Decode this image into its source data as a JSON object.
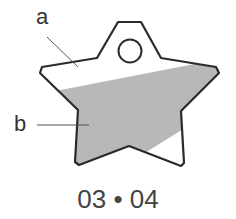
{
  "labels": {
    "a": "a",
    "b": "b"
  },
  "caption": "03 • 04",
  "colors": {
    "outline": "#2a2a2a",
    "shade": "#b8b8b8",
    "leader": "#555555"
  }
}
